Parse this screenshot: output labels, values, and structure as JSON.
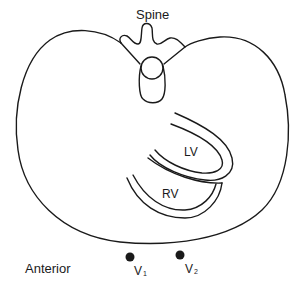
{
  "diagram": {
    "labels": {
      "spine": "Spine",
      "lv": "LV",
      "rv": "RV",
      "anterior": "Anterior",
      "v1_main": "V",
      "v1_sub": "1",
      "v2_main": "V",
      "v2_sub": "2"
    },
    "colors": {
      "stroke": "#1a1a1a",
      "background": "#ffffff"
    }
  }
}
